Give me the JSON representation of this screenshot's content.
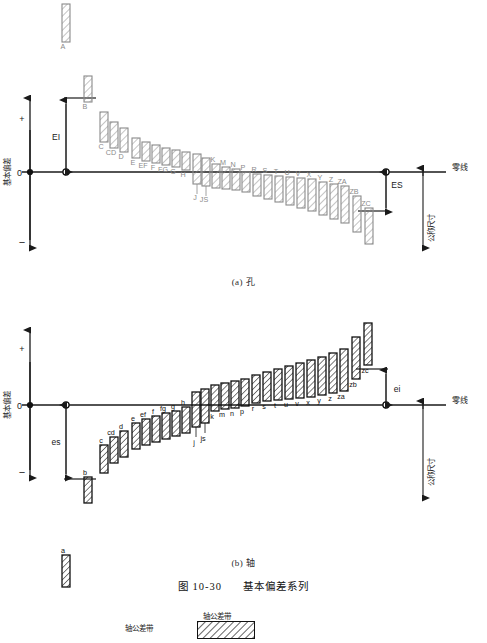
{
  "figure": {
    "caption_number": "图 10-30",
    "caption_title": "基本偏差系列",
    "sub_a": "(a) 孔",
    "sub_b": "(b) 轴",
    "zero_line_label": "零线",
    "nominal_size_label": "公称尺寸",
    "deviation_axis_label": "基本偏差",
    "plus_sign": "+",
    "minus_sign": "−",
    "zero_tick": "0"
  },
  "legend": {
    "left_label": "轴公差带",
    "box_label": "轴公差带"
  },
  "hole_chart": {
    "name": "(a) 孔",
    "ei_label": "EI",
    "es_label": "ES",
    "upper_letters": [
      "A",
      "B",
      "C",
      "CD",
      "D",
      "E",
      "EF",
      "F",
      "FG",
      "G",
      "H"
    ],
    "lower_letters": [
      "J",
      "JS",
      "K",
      "M",
      "N",
      "P",
      "R",
      "S",
      "T",
      "U",
      "V",
      "X",
      "Y",
      "Z",
      "ZA",
      "ZB",
      "ZC"
    ],
    "bars": [
      {
        "label": "A",
        "x": 66,
        "top": -168,
        "bottom": -130,
        "side": "above"
      },
      {
        "label": "B",
        "x": 88,
        "top": -96,
        "bottom": -70,
        "side": "above"
      },
      {
        "label": "C",
        "x": 104,
        "top": -60,
        "bottom": -30,
        "side": "above"
      },
      {
        "label": "CD",
        "x": 114,
        "top": -50,
        "bottom": -24,
        "side": "above"
      },
      {
        "label": "D",
        "x": 124,
        "top": -44,
        "bottom": -20,
        "side": "above"
      },
      {
        "label": "E",
        "x": 136,
        "top": -34,
        "bottom": -14,
        "side": "above"
      },
      {
        "label": "EF",
        "x": 146,
        "top": -30,
        "bottom": -11,
        "side": "above"
      },
      {
        "label": "F",
        "x": 156,
        "top": -27,
        "bottom": -9,
        "side": "above"
      },
      {
        "label": "FG",
        "x": 166,
        "top": -24,
        "bottom": -7,
        "side": "above"
      },
      {
        "label": "G",
        "x": 176,
        "top": -22,
        "bottom": -5,
        "side": "above"
      },
      {
        "label": "H",
        "x": 186,
        "top": -20,
        "bottom": -2,
        "side": "above"
      },
      {
        "label": "J",
        "x": 197,
        "top": -18,
        "bottom": 12,
        "side": "straddle"
      },
      {
        "label": "JS",
        "x": 206,
        "top": -14,
        "bottom": 14,
        "side": "straddle"
      },
      {
        "label": "K",
        "x": 216,
        "top": -8,
        "bottom": 16,
        "side": "below"
      },
      {
        "label": "M",
        "x": 226,
        "top": -5,
        "bottom": 17,
        "side": "below"
      },
      {
        "label": "N",
        "x": 236,
        "top": -3,
        "bottom": 18,
        "side": "below"
      },
      {
        "label": "P",
        "x": 246,
        "top": 0,
        "bottom": 20,
        "side": "below"
      },
      {
        "label": "R",
        "x": 257,
        "top": 2,
        "bottom": 24,
        "side": "below"
      },
      {
        "label": "S",
        "x": 268,
        "top": 3,
        "bottom": 27,
        "side": "below"
      },
      {
        "label": "T",
        "x": 279,
        "top": 4,
        "bottom": 30,
        "side": "below"
      },
      {
        "label": "U",
        "x": 290,
        "top": 5,
        "bottom": 33,
        "side": "below"
      },
      {
        "label": "V",
        "x": 301,
        "top": 6,
        "bottom": 36,
        "side": "below"
      },
      {
        "label": "X",
        "x": 312,
        "top": 7,
        "bottom": 39,
        "side": "below"
      },
      {
        "label": "Y",
        "x": 323,
        "top": 10,
        "bottom": 43,
        "side": "below"
      },
      {
        "label": "Z",
        "x": 334,
        "top": 12,
        "bottom": 47,
        "side": "below"
      },
      {
        "label": "ZA",
        "x": 345,
        "top": 14,
        "bottom": 51,
        "side": "below"
      },
      {
        "label": "ZB",
        "x": 357,
        "top": 24,
        "bottom": 60,
        "side": "below"
      },
      {
        "label": "ZC",
        "x": 369,
        "top": 36,
        "bottom": 72,
        "side": "below"
      }
    ]
  },
  "shaft_chart": {
    "name": "(b) 轴",
    "es_label": "es",
    "ei_label": "ei",
    "upper_letters": [
      "k",
      "m",
      "n",
      "p",
      "r",
      "s",
      "t",
      "u",
      "v",
      "x",
      "y",
      "z",
      "za",
      "zb",
      "zc"
    ],
    "lower_letters": [
      "a",
      "b",
      "c",
      "cd",
      "d",
      "e",
      "ef",
      "f",
      "fg",
      "g",
      "h",
      "j",
      "js"
    ],
    "bars": [
      {
        "label": "a",
        "x": 66,
        "top": 150,
        "bottom": 182,
        "side": "below"
      },
      {
        "label": "b",
        "x": 88,
        "top": 72,
        "bottom": 98,
        "side": "below"
      },
      {
        "label": "c",
        "x": 104,
        "top": 40,
        "bottom": 68,
        "side": "below"
      },
      {
        "label": "cd",
        "x": 114,
        "top": 32,
        "bottom": 58,
        "side": "below"
      },
      {
        "label": "d",
        "x": 124,
        "top": 26,
        "bottom": 52,
        "side": "below"
      },
      {
        "label": "e",
        "x": 136,
        "top": 18,
        "bottom": 44,
        "side": "below"
      },
      {
        "label": "ef",
        "x": 146,
        "top": 14,
        "bottom": 40,
        "side": "below"
      },
      {
        "label": "f",
        "x": 156,
        "top": 11,
        "bottom": 37,
        "side": "below"
      },
      {
        "label": "fg",
        "x": 166,
        "top": 8,
        "bottom": 34,
        "side": "below"
      },
      {
        "label": "g",
        "x": 176,
        "top": 6,
        "bottom": 31,
        "side": "below"
      },
      {
        "label": "h",
        "x": 186,
        "top": 2,
        "bottom": 28,
        "side": "below"
      },
      {
        "label": "j",
        "x": 196,
        "top": -13,
        "bottom": 22,
        "side": "straddle"
      },
      {
        "label": "js",
        "x": 205,
        "top": -16,
        "bottom": 18,
        "side": "straddle"
      },
      {
        "label": "k",
        "x": 215,
        "top": -20,
        "bottom": 6,
        "side": "above"
      },
      {
        "label": "m",
        "x": 225,
        "top": -22,
        "bottom": 4,
        "side": "above"
      },
      {
        "label": "n",
        "x": 235,
        "top": -24,
        "bottom": 3,
        "side": "above"
      },
      {
        "label": "p",
        "x": 245,
        "top": -26,
        "bottom": 1,
        "side": "above"
      },
      {
        "label": "r",
        "x": 256,
        "top": -30,
        "bottom": -2,
        "side": "above"
      },
      {
        "label": "s",
        "x": 267,
        "top": -33,
        "bottom": -4,
        "side": "above"
      },
      {
        "label": "t",
        "x": 278,
        "top": -36,
        "bottom": -5,
        "side": "above"
      },
      {
        "label": "u",
        "x": 289,
        "top": -39,
        "bottom": -6,
        "side": "above"
      },
      {
        "label": "v",
        "x": 300,
        "top": -42,
        "bottom": -7,
        "side": "above"
      },
      {
        "label": "x",
        "x": 311,
        "top": -45,
        "bottom": -8,
        "side": "above"
      },
      {
        "label": "y",
        "x": 322,
        "top": -48,
        "bottom": -10,
        "side": "above"
      },
      {
        "label": "z",
        "x": 333,
        "top": -52,
        "bottom": -12,
        "side": "above"
      },
      {
        "label": "za",
        "x": 344,
        "top": -56,
        "bottom": -14,
        "side": "above"
      },
      {
        "label": "zb",
        "x": 356,
        "top": -68,
        "bottom": -26,
        "side": "above"
      },
      {
        "label": "zc",
        "x": 368,
        "top": -82,
        "bottom": -40,
        "side": "above"
      }
    ]
  },
  "colors": {
    "hole_stroke": "#8a8a8a",
    "shaft_stroke": "#111111",
    "axis": "#1a1a1a",
    "background": "#ffffff"
  }
}
